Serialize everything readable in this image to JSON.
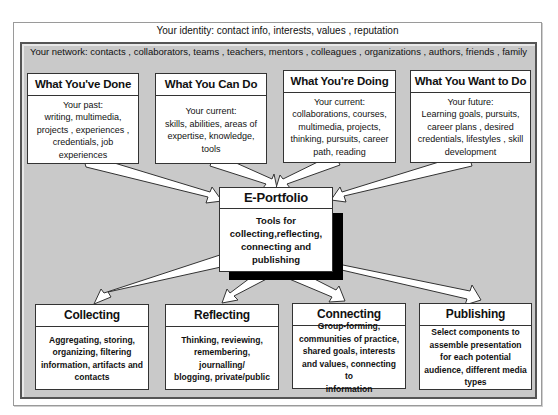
{
  "identity": {
    "label": "Your identity:  contact info, interests, values , reputation"
  },
  "network": {
    "label": "Your network:  contacts , collaborators, teams , teachers, mentors , colleagues , organizations , authors, friends , family"
  },
  "top_boxes": [
    {
      "title": "What You've Done",
      "body": "Your past:\nwriting, multimedia,\nprojects , experiences ,\ncredentials, job\nexperiences"
    },
    {
      "title": "What You Can Do",
      "body": "Your current:\nskills, abilities, areas of\nexpertise, knowledge,\ntools"
    },
    {
      "title": "What You're Doing",
      "body": "Your current:\ncollaborations, courses,\nmultimedia, projects,\nthinking, pursuits, career\npath, reading"
    },
    {
      "title": "What You Want to Do",
      "body": "Your future:\nLearning goals, pursuits,\ncareer plans , desired\ncredentials, lifestyles , skill\ndevelopment"
    }
  ],
  "center": {
    "title": "E-Portfolio",
    "body": "Tools for\ncollecting,reflecting,\nconnecting and\npublishing"
  },
  "bottom_boxes": [
    {
      "title": "Collecting",
      "body": "Aggregating, storing,\norganizing, filtering\ninformation, artifacts and\ncontacts"
    },
    {
      "title": "Reflecting",
      "body": "Thinking, reviewing,\nremembering, journalling/\nblogging, private/public"
    },
    {
      "title": "Connecting",
      "body": "Group-forming,\ncommunities of practice,\nshared goals, interests\nand values, connecting to\ninformation"
    },
    {
      "title": "Publishing",
      "body": "Select components to\nassemble presentation\nfor each potential\naudience, different media\ntypes"
    }
  ],
  "colors": {
    "network_bg": "#c9c9c9",
    "box_bg": "#ffffff",
    "border": "#333333",
    "shadow": "#000000"
  }
}
